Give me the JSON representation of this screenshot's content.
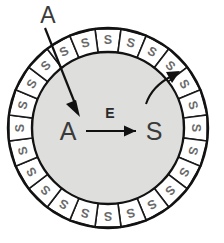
{
  "figure": {
    "title": "",
    "type": "cell-membrane-transport-diagram",
    "colors": {
      "interior_fill": "#dededc",
      "membrane_segment_fill": "#ffffff",
      "outline": "#121212",
      "segment_letter": "#6a6a6a",
      "center_text": "#3a3a3a",
      "background": "#ffffff"
    },
    "geometry": {
      "center_x": 108,
      "center_y": 128,
      "outer_radius": 100,
      "inner_radius": 76,
      "segment_count": 24
    }
  },
  "membrane": {
    "segment_label": "S",
    "segment_count": 24,
    "segments": [
      {
        "label": "S"
      },
      {
        "label": "S"
      },
      {
        "label": "S"
      },
      {
        "label": "S"
      },
      {
        "label": "S"
      },
      {
        "label": "S"
      },
      {
        "label": "S"
      },
      {
        "label": "S"
      },
      {
        "label": "S"
      },
      {
        "label": "S"
      },
      {
        "label": "S"
      },
      {
        "label": "S"
      },
      {
        "label": "S"
      },
      {
        "label": "S"
      },
      {
        "label": "S"
      },
      {
        "label": "S"
      },
      {
        "label": "S"
      },
      {
        "label": "S"
      },
      {
        "label": "S"
      },
      {
        "label": "S"
      },
      {
        "label": "S"
      },
      {
        "label": "S"
      },
      {
        "label": "S"
      },
      {
        "label": "S"
      }
    ]
  },
  "interior": {
    "reaction": {
      "substrate": "A",
      "catalyst": "E",
      "product": "S"
    }
  },
  "annotations": {
    "external_species": "A",
    "inward_arrow": "straight-arrow-into-interior",
    "outward_arrow": "curved-arrow-to-membrane"
  }
}
